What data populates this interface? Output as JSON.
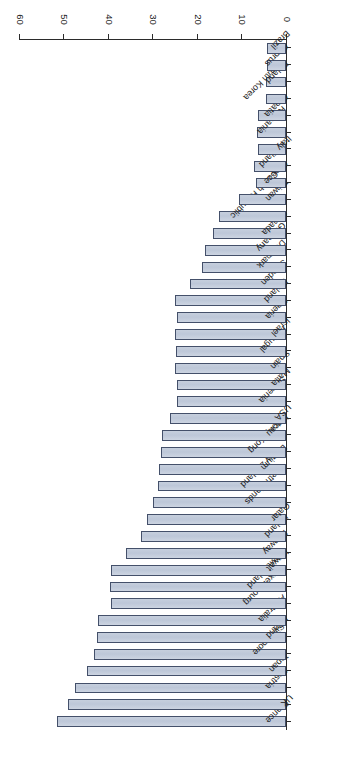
{
  "chart_data": {
    "type": "bar",
    "orientation": "horizontal",
    "title": "",
    "xlabel": "Coverage based on treatment (%)",
    "ylabel": "",
    "xlim": [
      0,
      60
    ],
    "xticks": [
      0,
      10,
      20,
      30,
      40,
      50,
      60
    ],
    "grid": false,
    "legend": null,
    "bar_fill_color": "#c3ccdb",
    "bar_edge_color": "#44506a",
    "axis_color": "#2b2b2b",
    "categories": [
      "France",
      "UK",
      "Austria",
      "Japan",
      "Singapore",
      "Ireland",
      "Australia",
      "Luxembourg",
      "Switzerland",
      "Kuwait",
      "Norway",
      "Iceland",
      "Qatar",
      "Netherlands",
      "New Zealand",
      "Belgium",
      "Hong Kong",
      "Macau",
      "USA",
      "Slovenia",
      "Malta",
      "Spain",
      "Portugal",
      "Israel",
      "Algeria",
      "Finland",
      "Sweden",
      "Denmark",
      "Germany",
      "Canada",
      "Czech Republic",
      "Taiwan",
      "Greece",
      "Thailand",
      "Italy",
      "Romania",
      "Croatia",
      "South Korea",
      "Poland",
      "Cyprus",
      "Brazil"
    ],
    "values": [
      51.5,
      49.0,
      47.4,
      44.7,
      43.1,
      42.5,
      42.2,
      39.3,
      39.5,
      39.3,
      36.0,
      32.6,
      31.2,
      29.9,
      28.8,
      28.5,
      28.1,
      27.9,
      26.1,
      24.5,
      24.5,
      25.0,
      24.7,
      25.0,
      24.5,
      25.0,
      21.6,
      18.9,
      18.2,
      16.4,
      15.1,
      10.6,
      6.7,
      7.2,
      6.3,
      6.5,
      6.3,
      4.5,
      4.5,
      4.3,
      4.3
    ]
  }
}
